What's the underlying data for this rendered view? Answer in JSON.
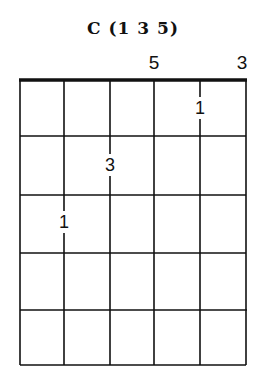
{
  "title": "C (1 3 5)",
  "top_labels": [
    {
      "text": "5",
      "string": 4,
      "x": 154
    },
    {
      "text": "3",
      "string": 6,
      "x": 244
    }
  ],
  "grid": {
    "strings": 6,
    "frets": 5,
    "string_x": [
      20,
      64,
      110,
      154,
      200,
      246
    ],
    "fret_y": [
      80,
      136,
      195,
      253,
      310,
      365
    ]
  },
  "fingers": [
    {
      "text": "1",
      "string": 5,
      "fret": 1,
      "x": 200,
      "y": 108
    },
    {
      "text": "3",
      "string": 3,
      "fret": 2,
      "x": 110,
      "y": 165
    },
    {
      "text": "1",
      "string": 2,
      "fret": 3,
      "x": 64,
      "y": 222
    }
  ]
}
